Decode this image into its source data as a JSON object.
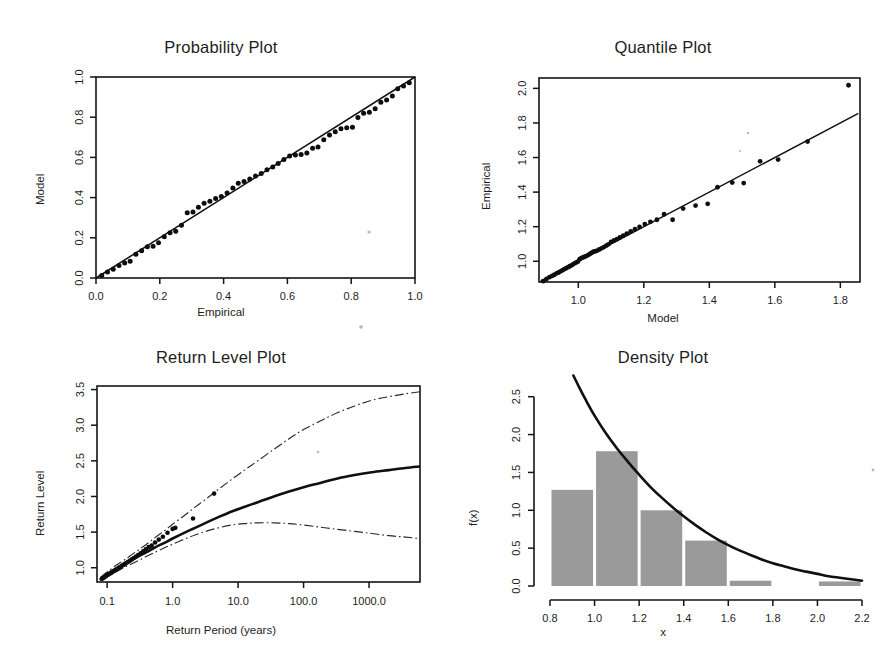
{
  "figure": {
    "background": "#ffffff",
    "point_color": "#0d0d0d",
    "line_color": "#101010",
    "hist_fill": "#9a9a9a"
  },
  "panels": [
    {
      "id": "probability-plot",
      "title": "Probability Plot",
      "xlabel": "Empirical",
      "ylabel": "Model"
    },
    {
      "id": "quantile-plot",
      "title": "Quantile Plot",
      "xlabel": "Model",
      "ylabel": "Empirical"
    },
    {
      "id": "return-level-plot",
      "title": "Return Level Plot",
      "xlabel": "Return Period (years)",
      "ylabel": "Return Level"
    },
    {
      "id": "density-plot",
      "title": "Density Plot",
      "xlabel": "x",
      "ylabel": "f(x)"
    }
  ],
  "chart_data": [
    {
      "type": "scatter",
      "id": "probability-plot",
      "title": "Probability Plot",
      "xlabel": "Empirical",
      "ylabel": "Model",
      "xlim": [
        0.0,
        1.0
      ],
      "ylim": [
        0.0,
        1.0
      ],
      "xticks": [
        "0.0",
        "0.2",
        "0.4",
        "0.6",
        "0.8",
        "1.0"
      ],
      "yticks": [
        "0.0",
        "0.2",
        "0.4",
        "0.6",
        "0.8",
        "1.0"
      ],
      "xtickvals": [
        0.0,
        0.2,
        0.4,
        0.6,
        0.8,
        1.0
      ],
      "ytickvals": [
        0.0,
        0.2,
        0.4,
        0.6,
        0.8,
        1.0
      ],
      "grid": false,
      "legend": "none",
      "reference_line": {
        "label": "y = x",
        "from": [
          0.0,
          0.0
        ],
        "to": [
          1.0,
          1.0
        ]
      },
      "x": [
        0.018,
        0.036,
        0.054,
        0.072,
        0.09,
        0.107,
        0.125,
        0.143,
        0.161,
        0.179,
        0.196,
        0.214,
        0.232,
        0.25,
        0.268,
        0.286,
        0.304,
        0.321,
        0.339,
        0.357,
        0.375,
        0.393,
        0.411,
        0.429,
        0.446,
        0.464,
        0.482,
        0.5,
        0.518,
        0.536,
        0.554,
        0.571,
        0.589,
        0.607,
        0.625,
        0.643,
        0.661,
        0.679,
        0.696,
        0.714,
        0.732,
        0.75,
        0.768,
        0.786,
        0.804,
        0.821,
        0.839,
        0.857,
        0.875,
        0.893,
        0.911,
        0.929,
        0.946,
        0.964,
        0.982
      ],
      "y": [
        0.012,
        0.03,
        0.044,
        0.062,
        0.075,
        0.083,
        0.118,
        0.135,
        0.155,
        0.158,
        0.175,
        0.205,
        0.225,
        0.232,
        0.262,
        0.325,
        0.328,
        0.352,
        0.372,
        0.382,
        0.395,
        0.405,
        0.423,
        0.448,
        0.472,
        0.48,
        0.492,
        0.508,
        0.52,
        0.538,
        0.552,
        0.57,
        0.59,
        0.607,
        0.612,
        0.615,
        0.622,
        0.645,
        0.652,
        0.688,
        0.712,
        0.728,
        0.742,
        0.748,
        0.75,
        0.798,
        0.82,
        0.825,
        0.842,
        0.875,
        0.885,
        0.905,
        0.942,
        0.955,
        0.972
      ]
    },
    {
      "type": "scatter",
      "id": "quantile-plot",
      "title": "Quantile Plot",
      "xlabel": "Model",
      "ylabel": "Empirical",
      "xlim": [
        0.88,
        1.86
      ],
      "ylim": [
        0.88,
        2.06
      ],
      "xticks": [
        "1.0",
        "1.2",
        "1.4",
        "1.6",
        "1.8"
      ],
      "yticks": [
        "1.0",
        "1.2",
        "1.4",
        "1.6",
        "1.8",
        "2.0"
      ],
      "xtickvals": [
        1.0,
        1.2,
        1.4,
        1.6,
        1.8
      ],
      "ytickvals": [
        1.0,
        1.2,
        1.4,
        1.6,
        1.8,
        2.0
      ],
      "grid": false,
      "legend": "none",
      "reference_line": {
        "label": "y = x",
        "from": [
          0.885,
          0.885
        ],
        "to": [
          1.855,
          1.855
        ]
      },
      "x": [
        0.893,
        0.903,
        0.912,
        0.92,
        0.927,
        0.934,
        0.94,
        0.946,
        0.952,
        0.958,
        0.963,
        0.969,
        0.974,
        0.979,
        0.984,
        0.989,
        0.994,
        0.999,
        1.004,
        1.009,
        1.014,
        1.019,
        1.024,
        1.03,
        1.035,
        1.04,
        1.046,
        1.052,
        1.058,
        1.064,
        1.071,
        1.078,
        1.085,
        1.092,
        1.1,
        1.109,
        1.118,
        1.127,
        1.137,
        1.148,
        1.16,
        1.173,
        1.187,
        1.203,
        1.22,
        1.24,
        1.262,
        1.288,
        1.32,
        1.358,
        1.395,
        1.425,
        1.47,
        1.505,
        1.555,
        1.61,
        1.7,
        1.825
      ],
      "y": [
        0.885,
        0.898,
        0.908,
        0.915,
        0.922,
        0.93,
        0.935,
        0.942,
        0.948,
        0.955,
        0.96,
        0.966,
        0.971,
        0.976,
        0.982,
        0.988,
        0.993,
        0.998,
        1.012,
        1.018,
        1.022,
        1.026,
        1.03,
        1.036,
        1.042,
        1.048,
        1.055,
        1.058,
        1.062,
        1.068,
        1.075,
        1.082,
        1.09,
        1.098,
        1.112,
        1.12,
        1.128,
        1.138,
        1.148,
        1.16,
        1.172,
        1.185,
        1.198,
        1.215,
        1.228,
        1.24,
        1.272,
        1.24,
        1.305,
        1.322,
        1.332,
        1.428,
        1.455,
        1.452,
        1.578,
        1.588,
        1.692,
        2.018
      ]
    },
    {
      "type": "line",
      "id": "return-level-plot",
      "title": "Return Level Plot",
      "xlabel": "Return Period (years)",
      "ylabel": "Return Level",
      "xscale": "log",
      "xlim": [
        0.07,
        6000
      ],
      "ylim": [
        0.8,
        3.55
      ],
      "xticks": [
        "0.1",
        "1.0",
        "10.0",
        "100.0",
        "1000.0"
      ],
      "yticks": [
        "1.0",
        "1.5",
        "2.0",
        "2.5",
        "3.0",
        "3.5"
      ],
      "xtickvals": [
        0.1,
        1.0,
        10.0,
        100.0,
        1000.0
      ],
      "ytickvals": [
        1.0,
        1.5,
        2.0,
        2.5,
        3.0,
        3.5
      ],
      "grid": false,
      "legend": "none",
      "series": [
        {
          "name": "Estimated return level",
          "style": "solid",
          "x": [
            0.08,
            0.1,
            0.13,
            0.17,
            0.22,
            0.3,
            0.4,
            0.55,
            0.75,
            1.0,
            1.5,
            2.2,
            3.2,
            5,
            8,
            13,
            20,
            35,
            60,
            100,
            180,
            320,
            600,
            1100,
            2000,
            3600,
            6000
          ],
          "y": [
            0.84,
            0.9,
            0.97,
            1.03,
            1.09,
            1.16,
            1.22,
            1.29,
            1.35,
            1.41,
            1.49,
            1.56,
            1.63,
            1.71,
            1.79,
            1.86,
            1.92,
            2.0,
            2.07,
            2.13,
            2.19,
            2.25,
            2.3,
            2.34,
            2.37,
            2.4,
            2.42
          ]
        },
        {
          "name": "Upper 95% confidence limit",
          "style": "dashdot",
          "x": [
            0.08,
            0.1,
            0.13,
            0.17,
            0.22,
            0.3,
            0.4,
            0.55,
            0.75,
            1.0,
            1.5,
            2.2,
            3.2,
            5,
            8,
            13,
            20,
            35,
            60,
            100,
            180,
            320,
            600,
            1100,
            2000,
            3600,
            6000
          ],
          "y": [
            0.87,
            0.94,
            1.02,
            1.09,
            1.16,
            1.25,
            1.33,
            1.43,
            1.52,
            1.61,
            1.73,
            1.85,
            1.96,
            2.1,
            2.24,
            2.38,
            2.5,
            2.66,
            2.81,
            2.94,
            3.06,
            3.17,
            3.27,
            3.35,
            3.4,
            3.44,
            3.47
          ]
        },
        {
          "name": "Lower 95% confidence limit",
          "style": "dashdot",
          "x": [
            0.08,
            0.1,
            0.13,
            0.17,
            0.22,
            0.3,
            0.4,
            0.55,
            0.75,
            1.0,
            1.5,
            2.2,
            3.2,
            5,
            8,
            13,
            20,
            35,
            60,
            100,
            180,
            320,
            600,
            1100,
            2000,
            3600,
            6000
          ],
          "y": [
            0.82,
            0.87,
            0.93,
            0.99,
            1.04,
            1.1,
            1.16,
            1.22,
            1.28,
            1.33,
            1.4,
            1.46,
            1.51,
            1.56,
            1.6,
            1.62,
            1.63,
            1.63,
            1.62,
            1.6,
            1.57,
            1.54,
            1.51,
            1.48,
            1.45,
            1.43,
            1.41
          ]
        },
        {
          "name": "Empirical data points",
          "style": "points",
          "x": [
            0.083,
            0.085,
            0.088,
            0.09,
            0.093,
            0.096,
            0.099,
            0.102,
            0.106,
            0.11,
            0.114,
            0.118,
            0.123,
            0.128,
            0.133,
            0.139,
            0.145,
            0.152,
            0.16,
            0.168,
            0.177,
            0.187,
            0.198,
            0.21,
            0.224,
            0.239,
            0.256,
            0.276,
            0.298,
            0.324,
            0.354,
            0.389,
            0.431,
            0.48,
            0.54,
            0.615,
            0.71,
            0.835,
            1.0,
            1.1,
            2.05,
            4.3
          ],
          "y": [
            0.845,
            0.852,
            0.86,
            0.868,
            0.876,
            0.884,
            0.893,
            0.901,
            0.91,
            0.919,
            0.928,
            0.938,
            0.948,
            0.958,
            0.968,
            0.979,
            0.99,
            1.002,
            1.014,
            1.027,
            1.04,
            1.054,
            1.069,
            1.084,
            1.1,
            1.118,
            1.137,
            1.157,
            1.179,
            1.203,
            1.229,
            1.258,
            1.291,
            1.31,
            1.355,
            1.395,
            1.435,
            1.49,
            1.545,
            1.56,
            1.69,
            2.04
          ]
        }
      ]
    },
    {
      "type": "bar",
      "id": "density-plot",
      "title": "Density Plot",
      "xlabel": "x",
      "ylabel": "f(x)",
      "xlim": [
        0.8,
        2.2
      ],
      "ylim": [
        0.0,
        2.8
      ],
      "xticks": [
        "0.8",
        "1.0",
        "1.2",
        "1.4",
        "1.6",
        "1.8",
        "2.0",
        "2.2"
      ],
      "yticks": [
        "0.0",
        "0.5",
        "1.0",
        "1.5",
        "2.0",
        "2.5"
      ],
      "xtickvals": [
        0.8,
        1.0,
        1.2,
        1.4,
        1.6,
        1.8,
        2.0,
        2.2
      ],
      "ytickvals": [
        0.0,
        0.5,
        1.0,
        1.5,
        2.0,
        2.5
      ],
      "grid": false,
      "legend": "none",
      "bin_edges": [
        0.8,
        1.0,
        1.2,
        1.4,
        1.6,
        1.8,
        2.0,
        2.2
      ],
      "categories": [
        "0.8-1.0",
        "1.0-1.2",
        "1.2-1.4",
        "1.4-1.6",
        "1.6-1.8",
        "1.8-2.0",
        "2.0-2.2"
      ],
      "values": [
        1.27,
        1.78,
        1.0,
        0.6,
        0.07,
        0.0,
        0.06
      ],
      "overlay_curve": {
        "name": "Fitted density",
        "x": [
          0.905,
          0.93,
          0.96,
          1.0,
          1.05,
          1.1,
          1.15,
          1.2,
          1.25,
          1.3,
          1.35,
          1.4,
          1.45,
          1.5,
          1.55,
          1.6,
          1.65,
          1.7,
          1.75,
          1.8,
          1.85,
          1.9,
          1.95,
          2.0,
          2.05,
          2.1,
          2.15,
          2.2
        ],
        "y": [
          2.78,
          2.63,
          2.46,
          2.25,
          2.02,
          1.82,
          1.64,
          1.47,
          1.31,
          1.17,
          1.04,
          0.92,
          0.81,
          0.71,
          0.62,
          0.54,
          0.47,
          0.41,
          0.35,
          0.3,
          0.26,
          0.22,
          0.19,
          0.16,
          0.13,
          0.11,
          0.09,
          0.07
        ]
      }
    }
  ]
}
